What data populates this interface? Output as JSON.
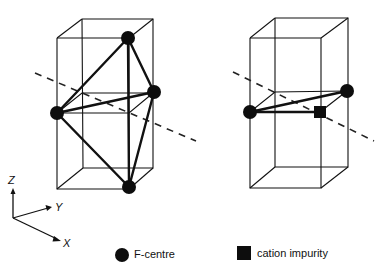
{
  "figure": {
    "left_panel": {
      "description": "F-centre cluster (four F-centres forming a tetrahedron) inside a unit cell",
      "atoms": [
        {
          "type": "F-centre",
          "position": "top"
        },
        {
          "type": "F-centre",
          "position": "middle-left"
        },
        {
          "type": "F-centre",
          "position": "middle-right"
        },
        {
          "type": "F-centre",
          "position": "bottom"
        }
      ]
    },
    "right_panel": {
      "description": "Two F-centres with a cation impurity forming a triangle inside a unit cell",
      "atoms": [
        {
          "type": "F-centre",
          "position": "middle-left"
        },
        {
          "type": "F-centre",
          "position": "middle-right"
        },
        {
          "type": "cation impurity",
          "position": "middle-front-right"
        }
      ]
    },
    "axes": {
      "z": "Z",
      "y": "Y",
      "x": "X"
    },
    "legend": {
      "f_centre": "F-centre",
      "cation_impurity": "cation impurity"
    },
    "colors": {
      "ink": "#111111",
      "background": "#ffffff"
    }
  }
}
